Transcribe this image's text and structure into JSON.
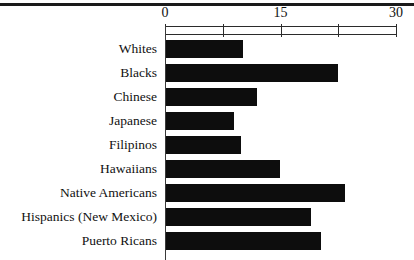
{
  "chart_data": {
    "type": "bar",
    "orientation": "horizontal",
    "title": "",
    "subtitle": "",
    "xlabel": "",
    "ylabel": "",
    "xlim": [
      0,
      30
    ],
    "grid": false,
    "legend": null,
    "axis": {
      "tick_values": [
        0,
        7.5,
        15,
        22.5,
        30
      ],
      "labeled_ticks": [
        0,
        15,
        30
      ],
      "tick_labels": [
        "0",
        "15",
        "30"
      ]
    },
    "categories": [
      "Whites",
      "Blacks",
      "Chinese",
      "Japanese",
      "Filipinos",
      "Hawaiians",
      "Native Americans",
      "Hispanics (New Mexico)",
      "Puerto Ricans"
    ],
    "values": [
      10.0,
      22.3,
      11.8,
      8.8,
      9.7,
      14.8,
      23.2,
      18.8,
      20.1
    ],
    "bar_color": "#0d0d0d",
    "axis_color": "#2b2b2b",
    "background_color": "#ffffff"
  }
}
